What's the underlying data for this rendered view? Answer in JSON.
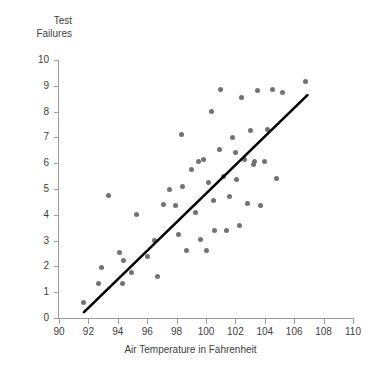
{
  "chart_data": {
    "type": "scatter",
    "title": "",
    "ylabel": "Test\nFailures",
    "xlabel": "Air Temperature in Fahrenheit",
    "xlim": [
      90,
      110
    ],
    "ylim": [
      0,
      10
    ],
    "xticks": [
      90,
      92,
      94,
      96,
      98,
      100,
      102,
      104,
      106,
      108,
      110
    ],
    "yticks": [
      0,
      1,
      2,
      3,
      4,
      5,
      6,
      7,
      8,
      9,
      10
    ],
    "grid": false,
    "legend": null,
    "marker_color": "#727272",
    "trendline_color": "#000000",
    "axis_color": "#9a9a9a",
    "trendline": {
      "type": "linear",
      "x_start": 91.7,
      "y_start": 0.23,
      "x_end": 106.9,
      "y_end": 8.64
    },
    "points": [
      [
        91.7,
        0.6
      ],
      [
        92.7,
        1.35
      ],
      [
        92.9,
        1.95
      ],
      [
        93.4,
        4.76
      ],
      [
        94.1,
        2.55
      ],
      [
        94.3,
        1.33
      ],
      [
        94.4,
        2.22
      ],
      [
        94.9,
        1.78
      ],
      [
        95.3,
        4.0
      ],
      [
        96.0,
        2.4
      ],
      [
        96.5,
        3.0
      ],
      [
        96.7,
        1.6
      ],
      [
        97.1,
        4.4
      ],
      [
        97.5,
        5.0
      ],
      [
        97.9,
        4.35
      ],
      [
        98.1,
        3.25
      ],
      [
        98.3,
        7.1
      ],
      [
        98.4,
        5.1
      ],
      [
        98.7,
        2.6
      ],
      [
        99.0,
        5.75
      ],
      [
        99.3,
        4.1
      ],
      [
        99.5,
        6.05
      ],
      [
        99.6,
        3.05
      ],
      [
        99.8,
        6.15
      ],
      [
        100.0,
        2.6
      ],
      [
        100.2,
        5.25
      ],
      [
        100.4,
        8.0
      ],
      [
        100.5,
        4.55
      ],
      [
        100.6,
        3.4
      ],
      [
        100.9,
        6.55
      ],
      [
        101.0,
        8.85
      ],
      [
        101.2,
        5.5
      ],
      [
        101.4,
        3.4
      ],
      [
        101.6,
        4.7
      ],
      [
        101.8,
        7.0
      ],
      [
        102.0,
        6.4
      ],
      [
        102.1,
        5.35
      ],
      [
        102.3,
        3.6
      ],
      [
        102.4,
        8.55
      ],
      [
        102.6,
        6.15
      ],
      [
        102.8,
        4.45
      ],
      [
        103.0,
        7.25
      ],
      [
        103.2,
        5.95
      ],
      [
        103.3,
        6.05
      ],
      [
        103.5,
        8.8
      ],
      [
        103.7,
        4.35
      ],
      [
        104.0,
        6.05
      ],
      [
        104.2,
        7.3
      ],
      [
        104.5,
        8.85
      ],
      [
        104.8,
        5.4
      ],
      [
        105.2,
        8.75
      ],
      [
        106.8,
        9.15
      ]
    ]
  }
}
